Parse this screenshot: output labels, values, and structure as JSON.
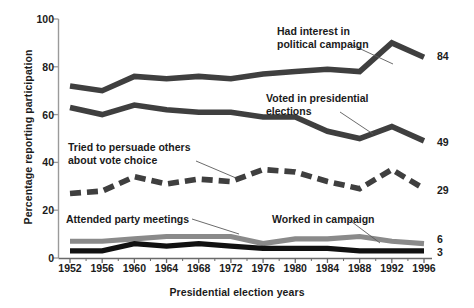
{
  "chart_data": {
    "type": "line",
    "title": "",
    "xlabel": "Presidential election years",
    "ylabel": "Percentage reporting participation",
    "categories": [
      "1952",
      "1956",
      "1960",
      "1964",
      "1968",
      "1972",
      "1976",
      "1980",
      "1984",
      "1988",
      "1992",
      "1996"
    ],
    "x": [
      1952,
      1956,
      1960,
      1964,
      1968,
      1972,
      1976,
      1980,
      1984,
      1988,
      1992,
      1996
    ],
    "xlim": [
      1952,
      1996
    ],
    "ylim": [
      0,
      100
    ],
    "yticks": [
      0,
      20,
      40,
      60,
      80,
      100
    ],
    "grid": false,
    "legend": "inline annotations",
    "series": [
      {
        "name": "Had interest in political campaign",
        "style": "solid-thick-dark",
        "color": "#3f3f3f",
        "end_value": "84",
        "values": [
          72,
          70,
          76,
          75,
          76,
          75,
          77,
          78,
          79,
          78,
          90,
          84
        ]
      },
      {
        "name": "Voted in presidential elections",
        "style": "solid-thick-dark",
        "color": "#3f3f3f",
        "end_value": "49",
        "values": [
          63,
          60,
          64,
          62,
          61,
          61,
          59,
          59,
          53,
          50,
          55,
          49
        ]
      },
      {
        "name": "Tried to persuade others about vote choice",
        "style": "dashed-thick-dark",
        "color": "#3f3f3f",
        "end_value": "29",
        "values": [
          27,
          28,
          34,
          31,
          33,
          32,
          37,
          36,
          32,
          29,
          37,
          29
        ]
      },
      {
        "name": "Attended party meetings",
        "style": "solid-thick-gray",
        "color": "#8a8a8a",
        "end_value": "6",
        "values": [
          7,
          7,
          8,
          9,
          9,
          9,
          6,
          8,
          8,
          9,
          7,
          6
        ]
      },
      {
        "name": "Worked in campaign",
        "style": "solid-thick-black",
        "color": "#111111",
        "end_value": "3",
        "values": [
          3,
          3,
          6,
          5,
          6,
          5,
          4,
          4,
          4,
          3,
          3,
          3
        ]
      }
    ],
    "annotations": [
      {
        "id": "had-interest",
        "lines": [
          "Had interest in",
          "political campaign"
        ]
      },
      {
        "id": "voted",
        "lines": [
          "Voted in presidential",
          "elections"
        ]
      },
      {
        "id": "persuade",
        "lines": [
          "Tried to persuade others",
          "about vote choice"
        ]
      },
      {
        "id": "attended",
        "lines": [
          "Attended party meetings"
        ]
      },
      {
        "id": "worked",
        "lines": [
          "Worked in campaign"
        ]
      }
    ]
  },
  "axis": {
    "y_ticks": [
      "100",
      "80",
      "60",
      "40",
      "20",
      "0"
    ],
    "x_ticks": [
      "1952",
      "1956",
      "1960",
      "1964",
      "1968",
      "1972",
      "1976",
      "1980",
      "1984",
      "1988",
      "1992",
      "1996"
    ],
    "y_title": "Percentage reporting participation",
    "x_title": "Presidential election years"
  },
  "end_labels": {
    "had_interest": "84",
    "voted": "49",
    "persuade": "29",
    "attended": "6",
    "worked": "3"
  },
  "annotations": {
    "had_interest_l1": "Had interest in",
    "had_interest_l2": "political campaign",
    "voted_l1": "Voted in presidential",
    "voted_l2": "elections",
    "persuade_l1": "Tried to persuade others",
    "persuade_l2": "about vote choice",
    "attended_l1": "Attended party meetings",
    "worked_l1": "Worked in campaign"
  }
}
